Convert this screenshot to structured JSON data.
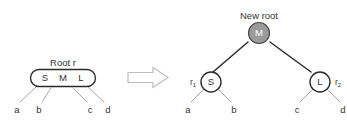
{
  "figure": {
    "title_left": "Root r",
    "title_right": "New root",
    "transform_symbol": "double-right-arrow"
  },
  "left_tree": {
    "caption": "Root r",
    "node": {
      "shape": "rounded-rect",
      "keys": [
        "S",
        "M",
        "L"
      ],
      "fill": "#ffffff",
      "stroke": "#2b2b2b"
    },
    "children": [
      "a",
      "b",
      "c",
      "d"
    ]
  },
  "right_tree": {
    "caption": "New root",
    "root": {
      "label": "M",
      "shape": "circle",
      "fill": "#9b9b9b",
      "text_color": "#ffffff"
    },
    "left_child": {
      "label": "S",
      "side_label": "r",
      "side_label_sub": "1",
      "fill": "#ffffff",
      "children": [
        "a",
        "b"
      ]
    },
    "right_child": {
      "label": "L",
      "side_label": "r",
      "side_label_sub": "2",
      "fill": "#ffffff",
      "children": [
        "c",
        "d"
      ]
    }
  }
}
